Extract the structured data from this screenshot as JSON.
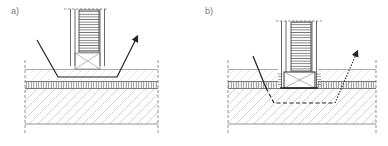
{
  "figure": {
    "panels": [
      {
        "id": "a",
        "label": "a)",
        "path_style": "solid",
        "description": "Column resting on top layer; solid path passes around under the column through top layer"
      },
      {
        "id": "b",
        "label": "b)",
        "path_style": "solid-dashed-dotted",
        "description": "Column embedded through layers; path goes down, dashed below the column, dotted upward"
      }
    ],
    "colors": {
      "line": "#222222",
      "hatch": "#aaaaaa",
      "layer_border": "#888888",
      "label": "#777777"
    }
  }
}
